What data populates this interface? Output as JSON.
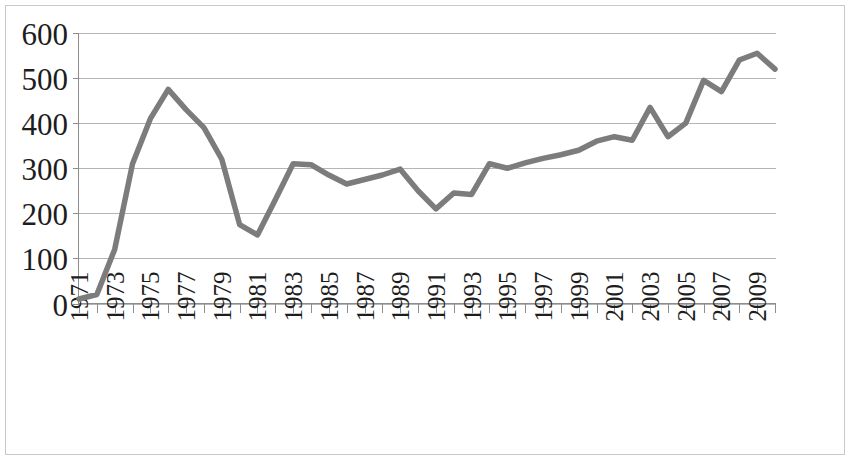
{
  "chart_data": {
    "type": "line",
    "title": "",
    "subtitle": "",
    "xlabel": "",
    "ylabel": "",
    "grid": true,
    "legend": false,
    "legend_position": "none",
    "line_color": "#7c7c7c",
    "x": [
      1971,
      1972,
      1973,
      1974,
      1975,
      1976,
      1977,
      1978,
      1979,
      1980,
      1981,
      1982,
      1983,
      1984,
      1985,
      1986,
      1987,
      1988,
      1989,
      1990,
      1991,
      1992,
      1993,
      1994,
      1995,
      1996,
      1997,
      1998,
      1999,
      2000,
      2001,
      2002,
      2003,
      2004,
      2005,
      2006,
      2007,
      2008,
      2009,
      2010
    ],
    "values": [
      10,
      20,
      120,
      310,
      410,
      475,
      430,
      390,
      320,
      175,
      152,
      230,
      310,
      308,
      285,
      265,
      275,
      285,
      298,
      250,
      210,
      245,
      242,
      310,
      300,
      312,
      322,
      330,
      340,
      360,
      370,
      362,
      435,
      370,
      400,
      495,
      470,
      540,
      555,
      520
    ],
    "ylim": [
      0,
      600
    ],
    "ytick_values": [
      0,
      100,
      200,
      300,
      400,
      500,
      600
    ],
    "ytick_labels": [
      "0",
      "100",
      "200",
      "300",
      "400",
      "500",
      "600"
    ],
    "xtick_labels": [
      "1971",
      "1973",
      "1975",
      "1977",
      "1979",
      "1981",
      "1983",
      "1985",
      "1987",
      "1989",
      "1991",
      "1993",
      "1995",
      "1997",
      "1999",
      "2001",
      "2003",
      "2005",
      "2007",
      "2009"
    ],
    "xtick_values": [
      1971,
      1973,
      1975,
      1977,
      1979,
      1981,
      1983,
      1985,
      1987,
      1989,
      1991,
      1993,
      1995,
      1997,
      1999,
      2001,
      2003,
      2005,
      2007,
      2009
    ],
    "xlim": [
      1971,
      2010
    ],
    "annotations": []
  }
}
